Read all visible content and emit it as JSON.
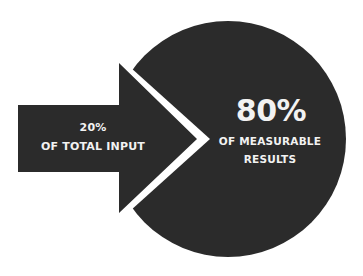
{
  "diagram": {
    "type": "pareto-principle",
    "colors": {
      "shape_fill": "#2b2b2b",
      "background": "#ffffff",
      "text": "#f2f2f2"
    },
    "input": {
      "percent": "20%",
      "label": "OF TOTAL INPUT"
    },
    "output": {
      "percent": "80%",
      "label_line1": "OF MEASURABLE",
      "label_line2": "RESULTS"
    }
  }
}
